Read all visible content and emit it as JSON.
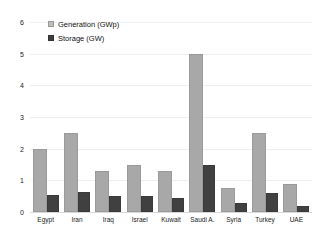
{
  "chart_data": {
    "type": "bar",
    "title": "",
    "subtitle": "",
    "xlabel": "",
    "ylabel": "",
    "ylim": [
      0,
      6
    ],
    "yticks": [
      "0",
      "1",
      "2",
      "3",
      "4",
      "5",
      "6"
    ],
    "grid": true,
    "legend_position": "top-left",
    "categories": [
      "Egypt",
      "Iran",
      "Iraq",
      "Israel",
      "Kuwait",
      "Saudi A.",
      "Syria",
      "Turkey",
      "UAE"
    ],
    "series": [
      {
        "name": "Generation (GWp)",
        "color": "#a8a8a8",
        "values": [
          2.0,
          2.5,
          1.3,
          1.5,
          1.3,
          5.0,
          0.75,
          2.5,
          0.9
        ]
      },
      {
        "name": "Storage (GW)",
        "color": "#404040",
        "values": [
          0.55,
          0.62,
          0.5,
          0.5,
          0.45,
          1.5,
          0.3,
          0.6,
          0.2
        ]
      }
    ]
  },
  "legend": {
    "items": [
      {
        "label": "Generation (GWp)",
        "swatch": "generation-swatch-icon"
      },
      {
        "label": "Storage (GW)",
        "swatch": "storage-swatch-icon"
      }
    ]
  },
  "axes": {
    "y": {
      "ticks": [
        "6",
        "5",
        "4",
        "3",
        "2",
        "1",
        "0"
      ]
    }
  }
}
